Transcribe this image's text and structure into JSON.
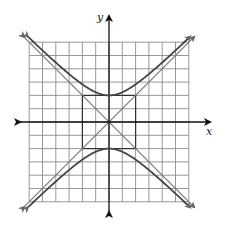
{
  "figure": {
    "axes": {
      "x_label": "x",
      "y_label": "y"
    },
    "grid": {
      "x_min": -6,
      "x_max": 6,
      "y_min": -6,
      "y_max": 6,
      "step": 1
    },
    "hyperbola": {
      "equation": "y^2/4 - x^2/4 = 1",
      "orientation": "vertical",
      "a": 2,
      "b": 2,
      "vertices": [
        [
          0,
          2
        ],
        [
          0,
          -2
        ]
      ]
    },
    "asymptotes": [
      "y = x",
      "y = -x"
    ],
    "fundamental_rectangle": {
      "x": [
        -2,
        2
      ],
      "y": [
        -2,
        2
      ]
    },
    "colors": {
      "grid": "#8c8c8c",
      "axes": "#111111",
      "curve": "#444444",
      "asymptote": "#7a7a7a",
      "rectangle": "#333333"
    }
  }
}
